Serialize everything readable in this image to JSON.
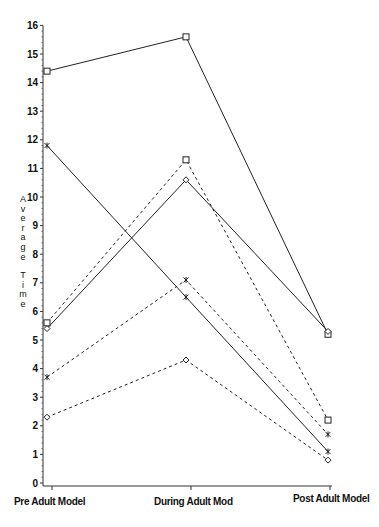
{
  "chart_data": {
    "type": "line",
    "title": "",
    "xlabel": "",
    "ylabel": "Average Time",
    "categories": [
      "Pre Adult Model",
      "During Adult Mod",
      "Post Adult Model"
    ],
    "ylim": [
      0,
      16
    ],
    "yticks": [
      0,
      1,
      2,
      3,
      4,
      5,
      6,
      7,
      8,
      9,
      10,
      11,
      12,
      13,
      14,
      15,
      16
    ],
    "grid": false,
    "legend": null,
    "series": [
      {
        "name": "solid-square",
        "line": "solid",
        "marker": "square",
        "values": [
          14.4,
          15.6,
          5.2
        ]
      },
      {
        "name": "solid-star",
        "line": "solid",
        "marker": "star",
        "values": [
          11.8,
          6.5,
          1.1
        ]
      },
      {
        "name": "solid-diamond",
        "line": "solid",
        "marker": "diamond",
        "values": [
          5.4,
          10.6,
          5.3
        ]
      },
      {
        "name": "dashed-square",
        "line": "dashed",
        "marker": "square",
        "values": [
          5.6,
          11.3,
          2.2
        ]
      },
      {
        "name": "dashed-star",
        "line": "dashed",
        "marker": "star",
        "values": [
          3.7,
          7.1,
          1.7
        ]
      },
      {
        "name": "dashed-diamond",
        "line": "dashed",
        "marker": "diamond",
        "values": [
          2.3,
          4.3,
          0.8
        ]
      }
    ]
  },
  "axis": {
    "ylabel_chars": [
      "A",
      "v",
      "e",
      "r",
      "a",
      "g",
      "e",
      "",
      "T",
      "i",
      "m",
      "e"
    ]
  }
}
